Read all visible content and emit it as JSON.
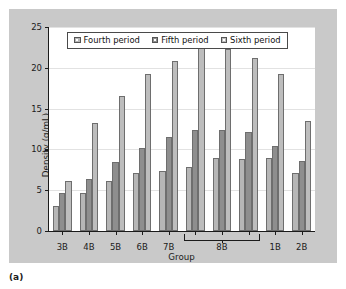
{
  "figure": {
    "caption": "(a)",
    "background_color": "#c9c9c9",
    "plot_background_color": "#ffffff"
  },
  "legend": {
    "position": "top-center-inside",
    "entries": [
      {
        "label": "Fourth period",
        "color": "#b6b6b6",
        "swatch_name": "legend-swatch-fourth-period"
      },
      {
        "label": "Fifth period",
        "color": "#8e8e8e",
        "swatch_name": "legend-swatch-fifth-period"
      },
      {
        "label": "Sixth period",
        "color": "#bdbdbd",
        "swatch_name": "legend-swatch-sixth-period"
      }
    ]
  },
  "axis": {
    "y_ticks": [
      "0",
      "5",
      "10",
      "15",
      "20",
      "25"
    ],
    "x_tick_labels": [
      "3B",
      "4B",
      "5B",
      "6B",
      "7B",
      "8B",
      "1B",
      "2B"
    ],
    "brace_label": "8B",
    "brace_spans_clusters": 3
  },
  "chart_data": {
    "type": "bar",
    "title": "",
    "xlabel": "Group",
    "ylabel": "Density (g/mL)",
    "ylim": [
      0,
      25
    ],
    "ytick_values": [
      0,
      5,
      10,
      15,
      20,
      25
    ],
    "grid": true,
    "legend_position": "upper center",
    "categories": [
      "3B",
      "4B",
      "5B",
      "6B",
      "7B",
      "8B-1",
      "8B-2",
      "8B-3",
      "1B",
      "2B"
    ],
    "category_display_labels": [
      "3B",
      "4B",
      "5B",
      "6B",
      "7B",
      "8B",
      "8B",
      "8B",
      "1B",
      "2B"
    ],
    "series": [
      {
        "name": "Fourth period",
        "color": "#b6b6b6",
        "values": [
          3.1,
          4.7,
          6.1,
          7.1,
          7.3,
          7.8,
          8.9,
          8.8,
          9.0,
          7.1
        ]
      },
      {
        "name": "Fifth period",
        "color": "#8e8e8e",
        "values": [
          4.6,
          6.4,
          8.5,
          10.2,
          11.5,
          12.4,
          12.4,
          12.1,
          10.4,
          8.6
        ]
      },
      {
        "name": "Sixth period",
        "color": "#bdbdbd",
        "values": [
          6.1,
          13.2,
          16.5,
          19.2,
          20.8,
          22.4,
          22.3,
          21.2,
          19.2,
          13.5
        ]
      }
    ]
  }
}
